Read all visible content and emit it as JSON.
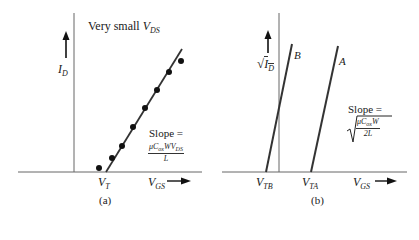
{
  "panel_a": {
    "title": "Very small",
    "title_var": "V",
    "title_sub": "DS",
    "y_axis_var": "I",
    "y_axis_sub": "D",
    "x_axis_var": "V",
    "x_axis_sub": "GS",
    "threshold_var": "V",
    "threshold_sub": "T",
    "slope_label": "Slope =",
    "slope_num": "μC",
    "slope_num_sub": "ox",
    "slope_num_rest": "WV",
    "slope_num_rest_sub": "DS",
    "slope_den": "L",
    "caption": "(a)"
  },
  "panel_b": {
    "y_axis_var": "I",
    "y_axis_sub": "D",
    "x_axis_var": "V",
    "x_axis_sub": "GS",
    "threshold_b_var": "V",
    "threshold_b_sub": "TB",
    "threshold_a_var": "V",
    "threshold_a_sub": "TA",
    "line_b_label": "B",
    "line_a_label": "A",
    "slope_label": "Slope =",
    "slope_num": "μC",
    "slope_num_sub": "ox",
    "slope_num_rest": "W",
    "slope_den": "2L",
    "caption": "(b)"
  },
  "colors": {
    "line": "#333333",
    "axis": "#555555"
  }
}
